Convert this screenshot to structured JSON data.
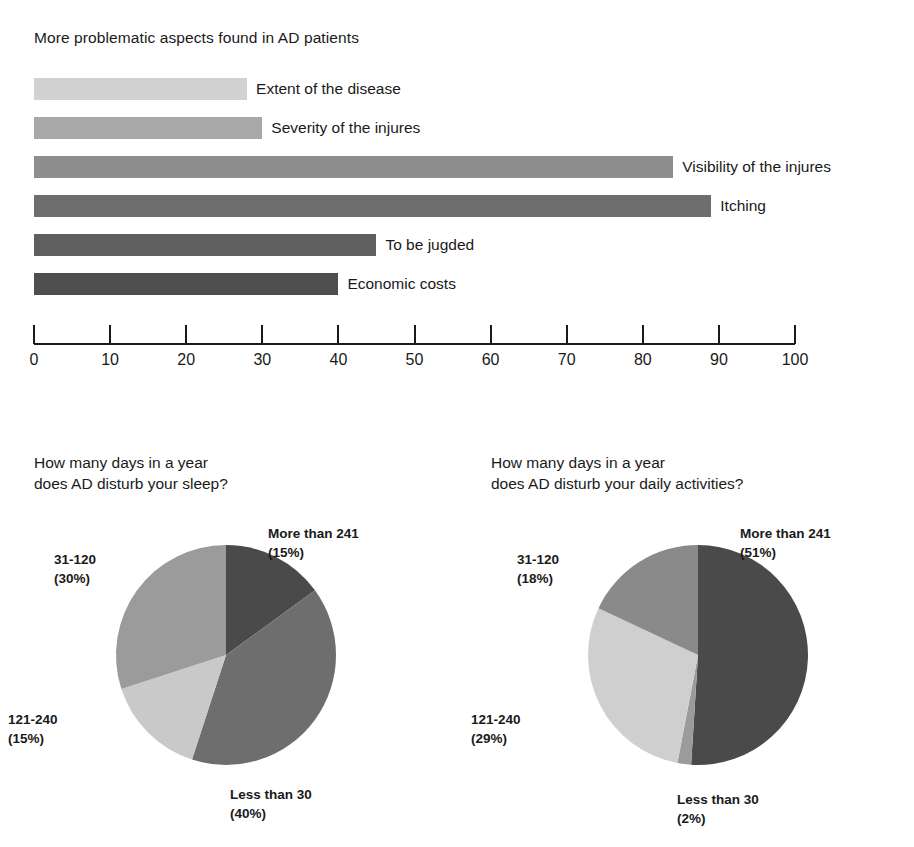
{
  "chart_data": [
    {
      "type": "bar",
      "orientation": "horizontal",
      "title": "More problematic aspects found in AD patients",
      "xlabel": "",
      "ylabel": "",
      "xlim": [
        0,
        100
      ],
      "grid": false,
      "legend": "none",
      "axis_ticks": [
        0,
        10,
        20,
        30,
        40,
        50,
        60,
        70,
        80,
        90,
        100
      ],
      "categories": [
        "Extent of the disease",
        "Severity of the injures",
        "Visibility of the injures",
        "Itching",
        "To be jugded",
        "Economic costs"
      ],
      "values": [
        28,
        30,
        84,
        89,
        45,
        40
      ],
      "bar_colors": [
        "#d2d2d2",
        "#a8a8a8",
        "#8d8d8d",
        "#6e6e6e",
        "#5f5f5f",
        "#4f4f4f"
      ]
    },
    {
      "type": "pie",
      "title": "How many days in a year\ndoes AD disturb your sleep?",
      "start_angle_deg": 0,
      "direction": "clockwise",
      "labels": [
        "More than 241",
        "Less than 30",
        "121-240",
        "31-120"
      ],
      "values": [
        15,
        40,
        15,
        30
      ],
      "value_texts": [
        "(15%)",
        "(40%)",
        "(15%)",
        "(30%)"
      ],
      "slice_colors": [
        "#4a4a4a",
        "#6e6e6e",
        "#c9c9c9",
        "#9b9b9b"
      ]
    },
    {
      "type": "pie",
      "title": "How many days in a year\ndoes AD disturb your daily activities?",
      "start_angle_deg": 0,
      "direction": "clockwise",
      "labels": [
        "More than 241",
        "Less than 30",
        "121-240",
        "31-120"
      ],
      "values": [
        51,
        2,
        29,
        18
      ],
      "value_texts": [
        "(51%)",
        "(2%)",
        "(29%)",
        "(18%)"
      ],
      "slice_colors": [
        "#4a4a4a",
        "#9b9b9b",
        "#cfcfcf",
        "#8a8a8a"
      ]
    }
  ],
  "bar_chart": {
    "title": "More problematic aspects found in AD patients",
    "bars": [
      {
        "label": "Extent of the disease",
        "value": 28,
        "color": "#d2d2d2"
      },
      {
        "label": "Severity of the injures",
        "value": 30,
        "color": "#a8a8a8"
      },
      {
        "label": "Visibility of the injures",
        "value": 84,
        "color": "#8d8d8d"
      },
      {
        "label": "Itching",
        "value": 89,
        "color": "#6e6e6e"
      },
      {
        "label": "To be jugded",
        "value": 45,
        "color": "#5f5f5f"
      },
      {
        "label": "Economic costs",
        "value": 40,
        "color": "#4f4f4f"
      }
    ],
    "axis": {
      "min": 0,
      "max": 100,
      "ticks": [
        "0",
        "10",
        "20",
        "30",
        "40",
        "50",
        "60",
        "70",
        "80",
        "90",
        "100"
      ]
    }
  },
  "pie_sleep": {
    "title": "How many days in a year\ndoes AD disturb your sleep?",
    "slices": [
      {
        "label": "More than 241",
        "percent_text": "(15%)",
        "value": 15,
        "color": "#4a4a4a"
      },
      {
        "label": "Less than 30",
        "percent_text": "(40%)",
        "value": 40,
        "color": "#6e6e6e"
      },
      {
        "label": "121-240",
        "percent_text": "(15%)",
        "value": 15,
        "color": "#c9c9c9"
      },
      {
        "label": "31-120",
        "percent_text": "(30%)",
        "value": 30,
        "color": "#9b9b9b"
      }
    ],
    "callouts": {
      "more_than_241": "More than 241\n(15%)",
      "less_than_30": "Less than 30\n(40%)",
      "r121_240": "121-240\n(15%)",
      "r31_120": "31-120\n(30%)"
    }
  },
  "pie_activities": {
    "title": "How many days in a year\ndoes AD disturb your daily activities?",
    "slices": [
      {
        "label": "More than 241",
        "percent_text": "(51%)",
        "value": 51,
        "color": "#4a4a4a"
      },
      {
        "label": "Less than 30",
        "percent_text": "(2%)",
        "value": 2,
        "color": "#9b9b9b"
      },
      {
        "label": "121-240",
        "percent_text": "(29%)",
        "value": 29,
        "color": "#cfcfcf"
      },
      {
        "label": "31-120",
        "percent_text": "(18%)",
        "value": 18,
        "color": "#8a8a8a"
      }
    ],
    "callouts": {
      "more_than_241": "More than 241\n(51%)",
      "less_than_30": "Less than 30\n(2%)",
      "r121_240": "121-240\n(29%)",
      "r31_120": "31-120\n(18%)"
    }
  }
}
